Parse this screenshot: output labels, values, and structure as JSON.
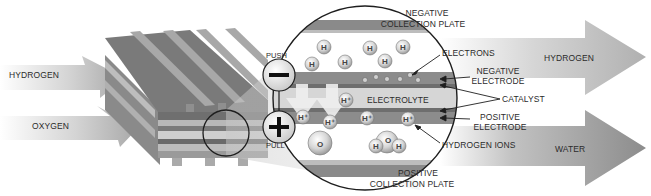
{
  "diagram": {
    "inputs": [
      {
        "label": "HYDROGEN"
      },
      {
        "label": "OXYGEN"
      }
    ],
    "outputs": [
      {
        "label": "HYDROGEN"
      },
      {
        "label": "WATER"
      }
    ],
    "terminals": {
      "negative": {
        "symbol": "−",
        "label": "PUSH"
      },
      "positive": {
        "symbol": "+",
        "label": "PULL"
      }
    },
    "layers": {
      "negative_collection_plate": {
        "line1": "NEGATIVE",
        "line2": "COLLECTION PLATE"
      },
      "electrons": "ELECTRONS",
      "negative_electrode": {
        "line1": "NEGATIVE",
        "line2": "ELECTRODE"
      },
      "catalyst": "CATALYST",
      "electrolyte": "ELECTROLYTE",
      "positive_electrode": {
        "line1": "POSITIVE",
        "line2": "ELECTRODE"
      },
      "hydrogen_ions": "HYDROGEN IONS",
      "positive_collection_plate": {
        "line1": "POSITIVE",
        "line2": "COLLECTION PLATE"
      }
    },
    "atoms": {
      "hydrogen": "H",
      "hydrogen_ion": "H⁺",
      "oxygen": "O",
      "water": [
        "H",
        "O",
        "H"
      ]
    },
    "colors": {
      "dark_plate": "#6e6e6e",
      "mid_plate": "#9a9a9a",
      "light_plate": "#c9c9c9",
      "arrow_light": "#efefef",
      "arrow_dark": "#8f8f8f",
      "text": "#2b2b2b"
    }
  }
}
